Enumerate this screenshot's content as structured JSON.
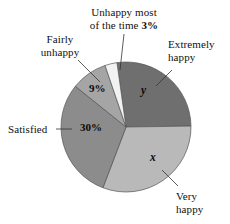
{
  "chart_data": {
    "type": "pie",
    "title": "",
    "subtitle": "",
    "xlabel": "",
    "ylabel": "",
    "legend_position": "callout-labels",
    "grid": false,
    "categories": [
      "Extremely happy",
      "Very happy",
      "Satisfied",
      "Fairly unhappy",
      "Unhappy most of the time"
    ],
    "values": [
      27,
      31,
      30,
      9,
      3
    ],
    "value_labels": [
      "y",
      "x",
      "30%",
      "9%",
      "3%"
    ],
    "colors": [
      "#6f6f6f",
      "#b9b9b9",
      "#8c8c8c",
      "#a5a5a5",
      "#f2f2f2"
    ],
    "start_angle_deg": -8,
    "direction": "clockwise"
  },
  "chart": {
    "center_x": 126,
    "center_y": 127,
    "radius": 65,
    "outline_color": "#555555"
  },
  "labels": {
    "unhappy_most": {
      "line1": "Unhappy most",
      "line2_text": "of the time ",
      "line2_pct": "3%"
    },
    "fairly_unhappy": {
      "line1": "Fairly",
      "line2": "unhappy"
    },
    "extremely_happy": {
      "line1": "Extremely",
      "line2": "happy"
    },
    "satisfied": {
      "line1": "Satisfied"
    },
    "very_happy": {
      "line1": "Very",
      "line2": "happy"
    }
  },
  "slice_values": {
    "extremely_happy": "y",
    "very_happy": "x",
    "satisfied": "30%",
    "fairly_unhappy": "9%"
  }
}
